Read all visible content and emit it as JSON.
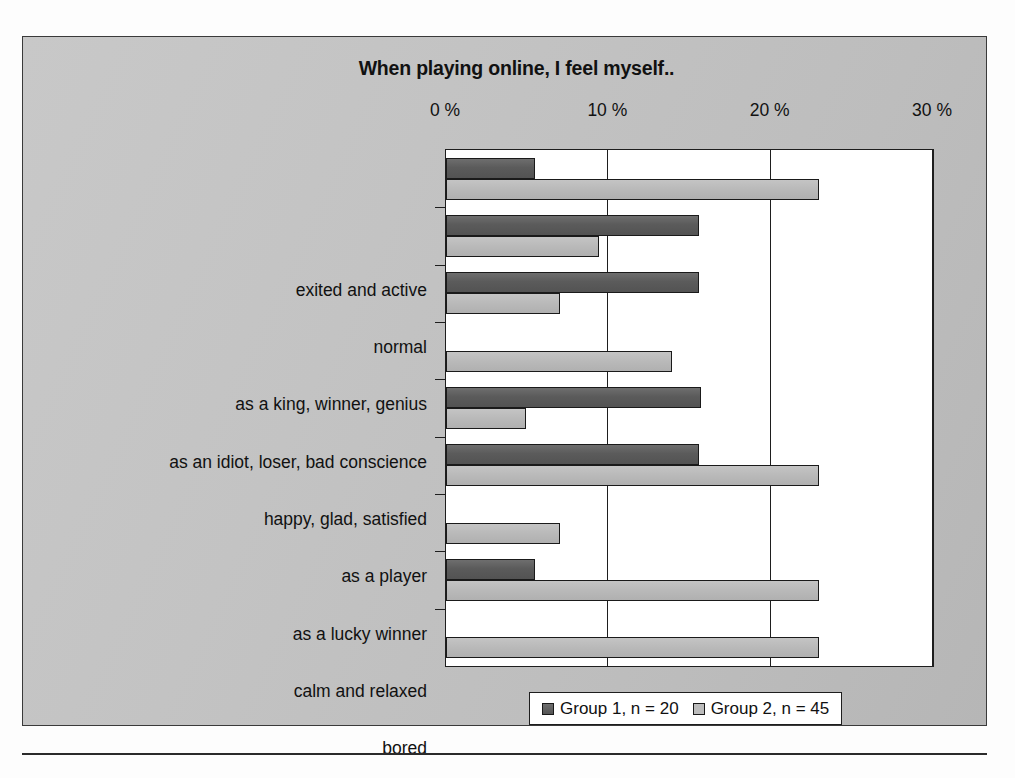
{
  "chart_data": {
    "type": "bar",
    "orientation": "horizontal",
    "title": "When playing online, I feel myself..",
    "xlabel": "",
    "ylabel": "",
    "xlim": [
      0,
      30
    ],
    "xticks": [
      0,
      10,
      20,
      30
    ],
    "xtick_labels": [
      "0 %",
      "10 %",
      "20 %",
      "30 %"
    ],
    "grid": true,
    "legend_position": "bottom",
    "categories": [
      "exited and active",
      "normal",
      "as a king, winner, genius",
      "as an idiot, loser, bad conscience",
      "happy, glad, satisfied",
      "as a player",
      "as a lucky winner",
      "calm and relaxed",
      "bored"
    ],
    "series": [
      {
        "name": "Group 1, n = 20",
        "color": "#5b5b5b",
        "values": [
          5.5,
          15.6,
          15.6,
          0,
          15.7,
          15.6,
          0,
          5.5,
          0
        ]
      },
      {
        "name": "Group 2, n = 45",
        "color": "#b9b9b9",
        "values": [
          23.0,
          9.4,
          7.0,
          13.9,
          4.9,
          23.0,
          7.0,
          23.0,
          23.0
        ]
      }
    ]
  },
  "figure": {
    "frame_color": "#c3c3c3",
    "plot_background": "#ffffff",
    "axis_color": "#1e1e1e"
  }
}
